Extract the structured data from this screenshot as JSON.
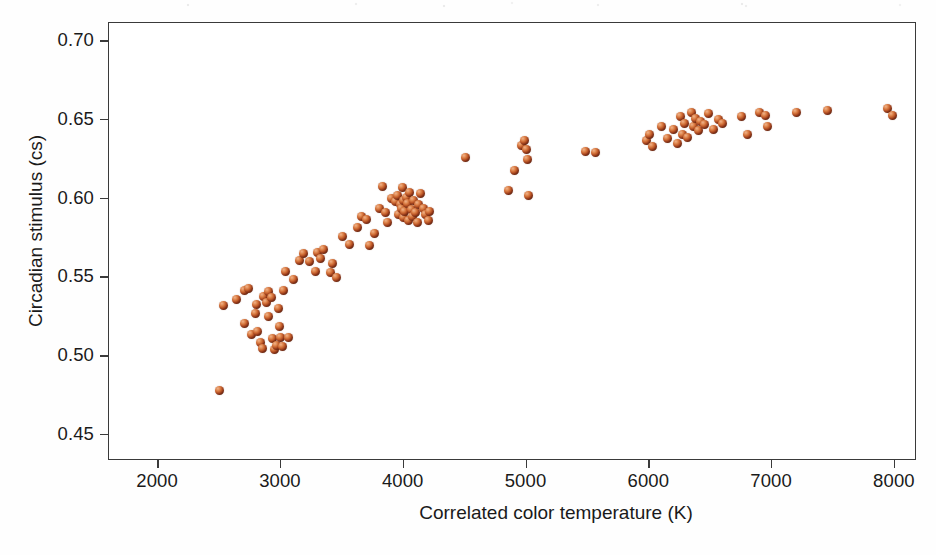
{
  "chart_data": {
    "type": "scatter",
    "title": "",
    "subtitle": "",
    "xlabel": "Correlated color temperature (K)",
    "ylabel": "Circadian stimulus (cs)",
    "xlim": [
      1600,
      8180
    ],
    "ylim": [
      0.4335,
      0.7115
    ],
    "xticks": [
      2000,
      3000,
      4000,
      5000,
      6000,
      7000,
      8000
    ],
    "xticklabels": [
      "2000",
      "3000",
      "4000",
      "5000",
      "6000",
      "7000",
      "8000"
    ],
    "yticks": [
      0.45,
      0.5,
      0.55,
      0.6,
      0.65,
      0.7
    ],
    "yticklabels": [
      "0.45",
      "0.50",
      "0.55",
      "0.60",
      "0.65",
      "0.70"
    ],
    "grid": false,
    "legend": null,
    "marker": {
      "style": "shaded-sphere",
      "size_px": 9,
      "fill": "#c55f2c",
      "highlight": "#f0b28c",
      "core": "#3a1408"
    },
    "axis_color": "#3a3a3a",
    "background": "#ffffff",
    "series": [
      {
        "name": "Light sources",
        "points": [
          [
            2500,
            0.478
          ],
          [
            2530,
            0.532
          ],
          [
            2640,
            0.536
          ],
          [
            2700,
            0.542
          ],
          [
            2740,
            0.543
          ],
          [
            2700,
            0.521
          ],
          [
            2760,
            0.514
          ],
          [
            2790,
            0.527
          ],
          [
            2800,
            0.533
          ],
          [
            2810,
            0.516
          ],
          [
            2830,
            0.509
          ],
          [
            2850,
            0.505
          ],
          [
            2860,
            0.538
          ],
          [
            2880,
            0.534
          ],
          [
            2900,
            0.525
          ],
          [
            2900,
            0.541
          ],
          [
            2920,
            0.537
          ],
          [
            2930,
            0.511
          ],
          [
            2950,
            0.504
          ],
          [
            2960,
            0.507
          ],
          [
            2980,
            0.53
          ],
          [
            2990,
            0.519
          ],
          [
            3000,
            0.512
          ],
          [
            3010,
            0.506
          ],
          [
            3020,
            0.542
          ],
          [
            3040,
            0.554
          ],
          [
            3060,
            0.512
          ],
          [
            3100,
            0.549
          ],
          [
            3150,
            0.561
          ],
          [
            3180,
            0.565
          ],
          [
            3230,
            0.56
          ],
          [
            3280,
            0.554
          ],
          [
            3300,
            0.566
          ],
          [
            3320,
            0.562
          ],
          [
            3350,
            0.568
          ],
          [
            3400,
            0.553
          ],
          [
            3420,
            0.559
          ],
          [
            3450,
            0.55
          ],
          [
            3500,
            0.576
          ],
          [
            3560,
            0.571
          ],
          [
            3620,
            0.582
          ],
          [
            3660,
            0.589
          ],
          [
            3700,
            0.587
          ],
          [
            3720,
            0.57
          ],
          [
            3760,
            0.578
          ],
          [
            3800,
            0.594
          ],
          [
            3830,
            0.608
          ],
          [
            3850,
            0.591
          ],
          [
            3870,
            0.585
          ],
          [
            3900,
            0.6
          ],
          [
            3930,
            0.598
          ],
          [
            3950,
            0.602
          ],
          [
            3960,
            0.59
          ],
          [
            3970,
            0.596
          ],
          [
            3980,
            0.594
          ],
          [
            3990,
            0.607
          ],
          [
            4000,
            0.599
          ],
          [
            4000,
            0.588
          ],
          [
            4010,
            0.592
          ],
          [
            4020,
            0.601
          ],
          [
            4030,
            0.597
          ],
          [
            4040,
            0.586
          ],
          [
            4050,
            0.604
          ],
          [
            4060,
            0.593
          ],
          [
            4070,
            0.589
          ],
          [
            4080,
            0.599
          ],
          [
            4100,
            0.591
          ],
          [
            4110,
            0.585
          ],
          [
            4120,
            0.596
          ],
          [
            4140,
            0.603
          ],
          [
            4160,
            0.594
          ],
          [
            4180,
            0.59
          ],
          [
            4200,
            0.586
          ],
          [
            4210,
            0.592
          ],
          [
            4500,
            0.626
          ],
          [
            4850,
            0.605
          ],
          [
            4900,
            0.618
          ],
          [
            4960,
            0.634
          ],
          [
            4980,
            0.637
          ],
          [
            5000,
            0.631
          ],
          [
            5010,
            0.625
          ],
          [
            5020,
            0.602
          ],
          [
            5480,
            0.63
          ],
          [
            5560,
            0.629
          ],
          [
            5980,
            0.637
          ],
          [
            6000,
            0.641
          ],
          [
            6030,
            0.633
          ],
          [
            6100,
            0.646
          ],
          [
            6150,
            0.638
          ],
          [
            6200,
            0.644
          ],
          [
            6230,
            0.635
          ],
          [
            6250,
            0.652
          ],
          [
            6270,
            0.641
          ],
          [
            6290,
            0.648
          ],
          [
            6310,
            0.639
          ],
          [
            6340,
            0.655
          ],
          [
            6360,
            0.646
          ],
          [
            6380,
            0.651
          ],
          [
            6400,
            0.643
          ],
          [
            6420,
            0.649
          ],
          [
            6450,
            0.647
          ],
          [
            6480,
            0.654
          ],
          [
            6520,
            0.644
          ],
          [
            6560,
            0.65
          ],
          [
            6600,
            0.648
          ],
          [
            6750,
            0.652
          ],
          [
            6800,
            0.641
          ],
          [
            6900,
            0.655
          ],
          [
            6950,
            0.653
          ],
          [
            6960,
            0.646
          ],
          [
            7200,
            0.655
          ],
          [
            7450,
            0.656
          ],
          [
            7940,
            0.657
          ],
          [
            7980,
            0.653
          ]
        ]
      }
    ]
  }
}
